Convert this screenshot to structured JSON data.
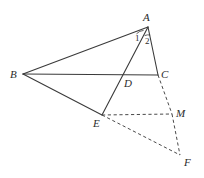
{
  "figure": {
    "kind": "geometry-diagram",
    "background_color": "#ffffff",
    "stroke_color": "#3a3a3a",
    "dashed_stroke_color": "#4a4a4a",
    "label_color": "#2b2b2b",
    "points": [
      {
        "id": "A",
        "label": "A",
        "x": 148,
        "y": 27,
        "label_x": 143,
        "label_y": 12
      },
      {
        "id": "B",
        "label": "B",
        "x": 23,
        "y": 74,
        "label_x": 10,
        "label_y": 69
      },
      {
        "id": "C",
        "label": "C",
        "x": 158,
        "y": 75,
        "label_x": 161,
        "label_y": 69
      },
      {
        "id": "D",
        "label": "D",
        "x": 128,
        "y": 76,
        "label_x": 124,
        "label_y": 78
      },
      {
        "id": "E",
        "label": "E",
        "x": 102,
        "y": 115,
        "label_x": 93,
        "label_y": 118
      },
      {
        "id": "M",
        "label": "M",
        "x": 172,
        "y": 114,
        "label_x": 176,
        "label_y": 108
      },
      {
        "id": "F",
        "label": "F",
        "x": 180,
        "y": 155,
        "label_x": 184,
        "label_y": 157
      }
    ],
    "angle_labels": [
      {
        "id": "angle-1",
        "label": "1",
        "x": 135,
        "y": 34
      },
      {
        "id": "angle-2",
        "label": "2",
        "x": 145,
        "y": 37
      }
    ],
    "solid_segments": [
      {
        "id": "segment-BA",
        "from": "B",
        "to": "A"
      },
      {
        "id": "segment-BC",
        "from": "B",
        "to": "C"
      },
      {
        "id": "segment-BE",
        "from": "B",
        "to": "E"
      },
      {
        "id": "segment-AC",
        "from": "A",
        "to": "C"
      },
      {
        "id": "segment-AE",
        "from": "A",
        "to": "E"
      }
    ],
    "dashed_segments": [
      {
        "id": "segment-CM",
        "from": "C",
        "to": "M"
      },
      {
        "id": "segment-EM",
        "from": "E",
        "to": "M"
      },
      {
        "id": "segment-EF",
        "from": "E",
        "to": "F"
      },
      {
        "id": "segment-MF",
        "from": "M",
        "to": "F"
      }
    ]
  }
}
